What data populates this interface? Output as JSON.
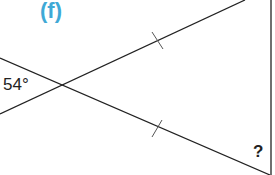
{
  "part_label": "(f)",
  "angle_given": "54°",
  "unknown": "?",
  "colors": {
    "part_label": "#3fa9d6",
    "lines": "#222222"
  },
  "geometry": {
    "intersection": [
      59,
      86
    ],
    "lines": [
      {
        "from": [
          0,
          58
        ],
        "to": [
          245,
          0
        ]
      },
      {
        "from": [
          0,
          114
        ],
        "to": [
          59,
          86
        ]
      },
      {
        "from": [
          0,
          58
        ],
        "to": [
          270,
          175
        ]
      },
      {
        "from": [
          271,
          0
        ],
        "to": [
          271,
          175
        ]
      }
    ],
    "tick_marks": [
      [
        157,
        41
      ],
      [
        157,
        129
      ]
    ]
  }
}
